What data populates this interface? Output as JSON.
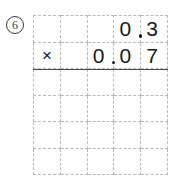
{
  "worksheet": {
    "problem_number": "6",
    "problem_number_style": "circled",
    "operation_symbol": "×",
    "operation_name": "multiplication",
    "multiplicand": "0.3",
    "multiplier": "0.07",
    "answer": "",
    "grid": {
      "columns": 5,
      "rows": 6,
      "line_style": "dashed",
      "line_color": "#b9b9b9",
      "rule_color": "#4a4a4a"
    },
    "rows": [
      {
        "name": "multiplicand-row",
        "cells": [
          {
            "text": "",
            "decimal": false
          },
          {
            "text": "",
            "decimal": false
          },
          {
            "text": "",
            "decimal": false
          },
          {
            "text": "0",
            "decimal": true
          },
          {
            "text": "3",
            "decimal": false
          }
        ]
      },
      {
        "name": "multiplier-row",
        "cells": [
          {
            "text": "×",
            "decimal": false
          },
          {
            "text": "",
            "decimal": false
          },
          {
            "text": "0",
            "decimal": true
          },
          {
            "text": "0",
            "decimal": false
          },
          {
            "text": "7",
            "decimal": false
          }
        ]
      },
      {
        "name": "work-row-1",
        "cells": [
          {
            "text": "",
            "decimal": false
          },
          {
            "text": "",
            "decimal": false
          },
          {
            "text": "",
            "decimal": false
          },
          {
            "text": "",
            "decimal": false
          },
          {
            "text": "",
            "decimal": false
          }
        ]
      },
      {
        "name": "work-row-2",
        "cells": [
          {
            "text": "",
            "decimal": false
          },
          {
            "text": "",
            "decimal": false
          },
          {
            "text": "",
            "decimal": false
          },
          {
            "text": "",
            "decimal": false
          },
          {
            "text": "",
            "decimal": false
          }
        ]
      },
      {
        "name": "work-row-3",
        "cells": [
          {
            "text": "",
            "decimal": false
          },
          {
            "text": "",
            "decimal": false
          },
          {
            "text": "",
            "decimal": false
          },
          {
            "text": "",
            "decimal": false
          },
          {
            "text": "",
            "decimal": false
          }
        ]
      },
      {
        "name": "work-row-4",
        "cells": [
          {
            "text": "",
            "decimal": false
          },
          {
            "text": "",
            "decimal": false
          },
          {
            "text": "",
            "decimal": false
          },
          {
            "text": "",
            "decimal": false
          },
          {
            "text": "",
            "decimal": false
          }
        ]
      }
    ]
  }
}
